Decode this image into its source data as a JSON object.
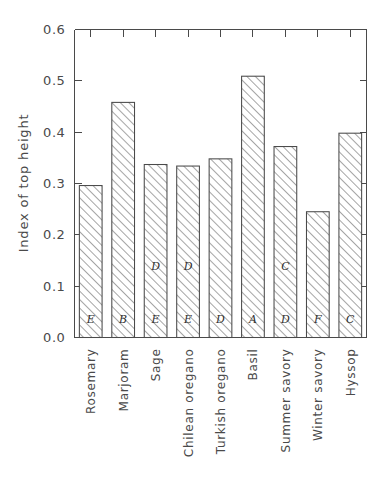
{
  "chart_data": {
    "type": "bar",
    "title": "",
    "xlabel": "",
    "ylabel": "Index of top height",
    "ylim": [
      0.0,
      0.6
    ],
    "ytick_labels": [
      "0.0",
      "0.1",
      "0.2",
      "0.3",
      "0.4",
      "0.5",
      "0.6"
    ],
    "ytick_values": [
      0.0,
      0.1,
      0.2,
      0.3,
      0.4,
      0.5,
      0.6
    ],
    "grid": false,
    "legend": "none",
    "categories": [
      "Rosemary",
      "Marjoram",
      "Sage",
      "Chilean oregano",
      "Turkish oregano",
      "Basil",
      "Summer savory",
      "Winter savory",
      "Hyssop"
    ],
    "values": [
      0.296,
      0.458,
      0.337,
      0.334,
      0.348,
      0.509,
      0.372,
      0.245,
      0.398
    ],
    "series": [
      {
        "name": "Index of top height",
        "values": [
          0.296,
          0.458,
          0.337,
          0.334,
          0.348,
          0.509,
          0.372,
          0.245,
          0.398
        ]
      }
    ],
    "annotations": [
      {
        "category": "Rosemary",
        "letters": [
          "E"
        ]
      },
      {
        "category": "Marjoram",
        "letters": [
          "B"
        ]
      },
      {
        "category": "Sage",
        "letters": [
          "D",
          "E"
        ]
      },
      {
        "category": "Chilean oregano",
        "letters": [
          "D",
          "E"
        ]
      },
      {
        "category": "Turkish oregano",
        "letters": [
          "D"
        ]
      },
      {
        "category": "Basil",
        "letters": [
          "A"
        ]
      },
      {
        "category": "Summer savory",
        "letters": [
          "C",
          "D"
        ]
      },
      {
        "category": "Winter savory",
        "letters": [
          "F"
        ]
      },
      {
        "category": "Hyssop",
        "letters": [
          "C"
        ]
      }
    ],
    "style": {
      "bar_fill": "hatch-45-diagonal",
      "line_color": "#4a4a4a",
      "background": "#ffffff"
    }
  }
}
